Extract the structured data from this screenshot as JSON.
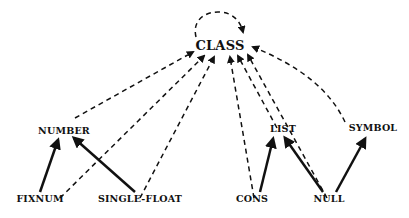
{
  "diagram": {
    "root": "CLASS",
    "nodes": {
      "class": "CLASS",
      "number": "NUMBER",
      "list": "LIST",
      "symbol": "SYMBOL",
      "fixnum": "FIXNUM",
      "single_float": "SINGLE-FLOAT",
      "cons": "CONS",
      "null": "NULL"
    },
    "edges_instance_of": [
      [
        "CLASS",
        "CLASS"
      ],
      [
        "NUMBER",
        "CLASS"
      ],
      [
        "FIXNUM",
        "CLASS"
      ],
      [
        "SINGLE-FLOAT",
        "CLASS"
      ],
      [
        "CONS",
        "CLASS"
      ],
      [
        "LIST",
        "CLASS"
      ],
      [
        "NULL",
        "CLASS"
      ],
      [
        "SYMBOL",
        "CLASS"
      ]
    ],
    "edges_subclass_of": [
      [
        "FIXNUM",
        "NUMBER"
      ],
      [
        "SINGLE-FLOAT",
        "NUMBER"
      ],
      [
        "CONS",
        "LIST"
      ],
      [
        "NULL",
        "LIST"
      ],
      [
        "NULL",
        "SYMBOL"
      ]
    ],
    "legend": {
      "dashed": "instance-of",
      "solid": "subclass-of"
    }
  }
}
